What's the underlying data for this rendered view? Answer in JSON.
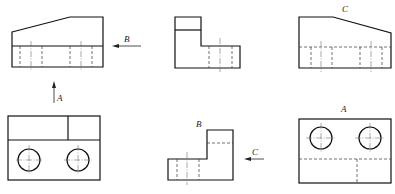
{
  "labels": {
    "arrow_a": "A",
    "arrow_b": "B",
    "arrow_c": "C",
    "view_a": "A",
    "view_b": "B",
    "view_c": "C"
  },
  "views": [
    {
      "id": "front-view",
      "position": "top-left"
    },
    {
      "id": "side-view",
      "position": "top-middle"
    },
    {
      "id": "view-c",
      "position": "top-right",
      "label": "C"
    },
    {
      "id": "top-view",
      "position": "bottom-left"
    },
    {
      "id": "view-b",
      "position": "bottom-middle",
      "label": "B"
    },
    {
      "id": "view-a",
      "position": "bottom-right",
      "label": "A"
    }
  ],
  "colors": {
    "line": "#111111",
    "background": "#ffffff"
  }
}
